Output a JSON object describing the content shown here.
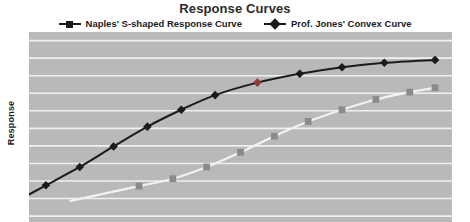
{
  "chart_data": {
    "type": "line",
    "title": "Response Curves",
    "xlabel": "",
    "ylabel": "Response",
    "grid": "horizontal",
    "legend_position": "top-center",
    "xlim": [
      0,
      10
    ],
    "ylim": [
      0,
      10
    ],
    "axis_ticks_visible": false,
    "note": "Plot area is cropped at the bottom edge of the screenshot; both curves continue below the visible region.",
    "series": [
      {
        "name": "Naples' S-shaped Response Curve",
        "marker": "square",
        "line_color": "#f2f2f2",
        "marker_color": "#8a8a8a",
        "x": [
          2.6,
          3.4,
          4.2,
          5.0,
          5.8,
          6.6,
          7.4,
          8.2,
          9.0,
          9.6
        ],
        "y": [
          0.05,
          0.55,
          1.35,
          2.35,
          3.45,
          4.45,
          5.25,
          5.95,
          6.45,
          6.75
        ]
      },
      {
        "name": "Prof. Jones' Convex Curve",
        "marker": "diamond",
        "line_color": "#1b1b1b",
        "marker_color": "#1b1b1b",
        "highlight_marker_index": 6,
        "highlight_marker_color": "#8c3a32",
        "x": [
          0.4,
          1.2,
          2.0,
          2.8,
          3.6,
          4.4,
          5.4,
          6.4,
          7.4,
          8.4,
          9.6
        ],
        "y": [
          0.1,
          1.35,
          2.75,
          4.1,
          5.25,
          6.25,
          7.1,
          7.7,
          8.15,
          8.45,
          8.65
        ]
      }
    ]
  },
  "title": "Response Curves",
  "legend": {
    "entries": [
      {
        "label": "Naples' S-shaped Response Curve",
        "marker": "square"
      },
      {
        "label": "Prof. Jones' Convex Curve",
        "marker": "diamond"
      }
    ]
  },
  "axes": {
    "y_label": "Response"
  },
  "colors": {
    "plot_background": "#b9b9b9",
    "gridline": "#f0f0f0",
    "dark_curve": "#1b1b1b",
    "light_curve": "#f2f2f2",
    "light_marker": "#8a8a8a",
    "highlight_marker": "#8c3a32",
    "title_text": "#2b2b2b",
    "label_text": "#1b1b1b"
  }
}
